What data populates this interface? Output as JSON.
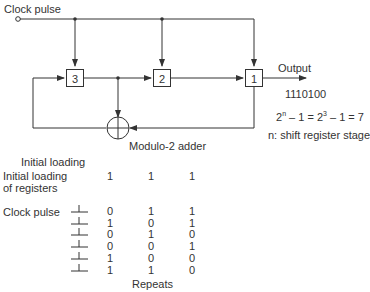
{
  "diagram": {
    "clock_label": "Clock pulse",
    "registers": [
      {
        "label": "3"
      },
      {
        "label": "2"
      },
      {
        "label": "1"
      }
    ],
    "output_label": "Output",
    "output_sequence": "1110100",
    "formula": {
      "base": "2",
      "exp1": "n",
      "mid": " – 1 = 2",
      "exp2": "3",
      "tail": " – 1 = 7"
    },
    "note": "n: shift register stage",
    "adder_label": "Modulo-2 adder"
  },
  "table": {
    "title": "Initial loading",
    "initial_label_line1": "Initial loading",
    "initial_label_line2": "of registers",
    "initial_values": [
      "1",
      "1",
      "1"
    ],
    "clock_label": "Clock pulse",
    "rows": [
      [
        "0",
        "1",
        "1"
      ],
      [
        "1",
        "0",
        "1"
      ],
      [
        "0",
        "1",
        "0"
      ],
      [
        "0",
        "0",
        "1"
      ],
      [
        "1",
        "0",
        "0"
      ],
      [
        "1",
        "1",
        "0"
      ]
    ],
    "footer": "Repeats"
  }
}
